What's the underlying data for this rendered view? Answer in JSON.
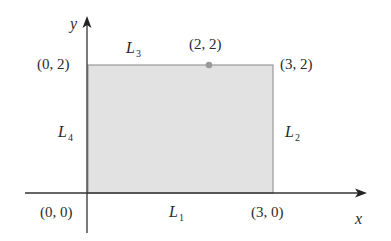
{
  "diagram": {
    "type": "coordinate-region",
    "axes": {
      "x_label": "x",
      "y_label": "y"
    },
    "vertices": {
      "origin": "(0, 0)",
      "bottom_right": "(3, 0)",
      "top_right": "(3, 2)",
      "top_left": "(0, 2)"
    },
    "point": {
      "label": "(2, 2)",
      "x": 2,
      "y": 2
    },
    "edges": {
      "L1": {
        "name": "L",
        "sub": "1",
        "from": "(0, 0)",
        "to": "(3, 0)"
      },
      "L2": {
        "name": "L",
        "sub": "2",
        "from": "(3, 0)",
        "to": "(3, 2)"
      },
      "L3": {
        "name": "L",
        "sub": "3",
        "from": "(3, 2)",
        "to": "(0, 2)"
      },
      "L4": {
        "name": "L",
        "sub": "4",
        "from": "(0, 2)",
        "to": "(0, 0)"
      }
    },
    "colors": {
      "fill": "#e2e2e2",
      "border": "#9a9a9a",
      "axis": "#333333",
      "point": "#9a9a9a"
    }
  }
}
